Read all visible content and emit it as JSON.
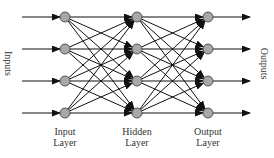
{
  "diagram": {
    "layers": [
      {
        "name": "input",
        "label_line1": "Input",
        "label_line2": "Layer",
        "x": 65
      },
      {
        "name": "hidden",
        "label_line1": "Hidden",
        "label_line2": "Layer",
        "x": 137
      },
      {
        "name": "output",
        "label_line1": "Output",
        "label_line2": "Layer",
        "x": 208
      }
    ],
    "rows_y": [
      17,
      49,
      81,
      113
    ],
    "node_radius": 5,
    "node_fill": "#a8a8a8",
    "edge_color": "#111111",
    "inputs_label": "Inputs",
    "outputs_label": "Outputs",
    "input_arrow_start_x": 22,
    "output_arrow_end_x": 250
  }
}
